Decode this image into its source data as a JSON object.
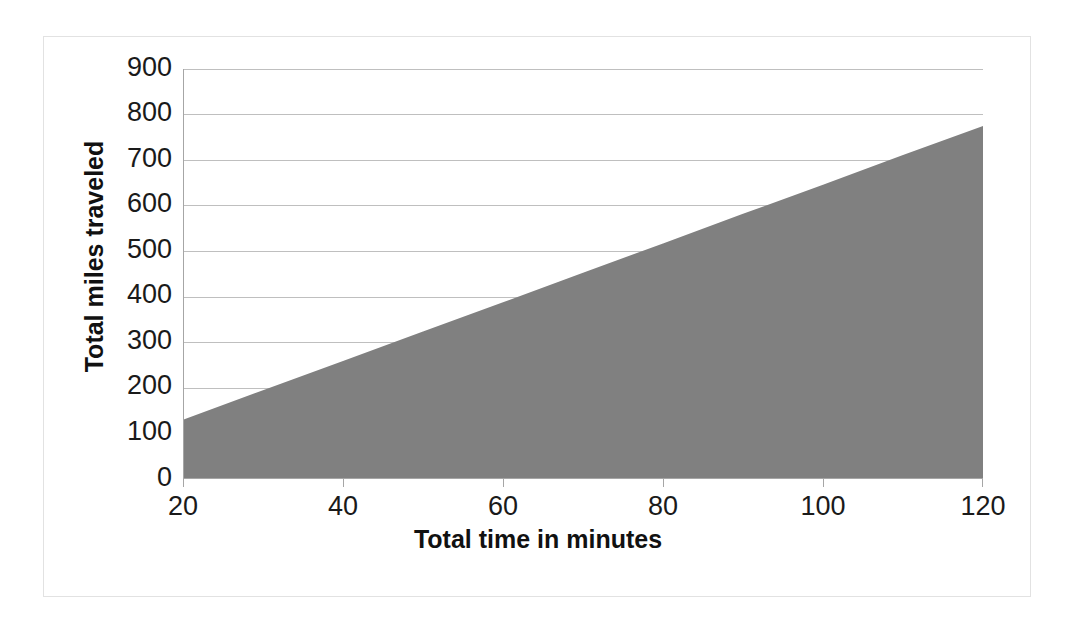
{
  "chart_data": {
    "type": "area",
    "title": "",
    "xlabel": "Total time in minutes",
    "ylabel": "Total miles traveled",
    "xlim": [
      20,
      120
    ],
    "ylim": [
      0,
      900
    ],
    "x_ticks": [
      20,
      40,
      60,
      80,
      100,
      120
    ],
    "y_ticks": [
      0,
      100,
      200,
      300,
      400,
      500,
      600,
      700,
      800,
      900
    ],
    "grid": "horizontal",
    "legend": "none",
    "series": [
      {
        "name": "Total miles traveled",
        "fill_color": "#808080",
        "x": [
          20,
          30,
          40,
          50,
          60,
          70,
          80,
          90,
          100,
          110,
          120
        ],
        "values": [
          130,
          195,
          259,
          324,
          388,
          453,
          517,
          582,
          646,
          711,
          775
        ]
      }
    ],
    "annotations": []
  },
  "axes": {
    "y": {
      "label": "Total miles traveled",
      "ticks": [
        "900",
        "800",
        "700",
        "600",
        "500",
        "400",
        "300",
        "200",
        "100",
        "0"
      ]
    },
    "x": {
      "label": "Total time in minutes",
      "ticks": [
        "20",
        "40",
        "60",
        "80",
        "100",
        "120"
      ]
    }
  },
  "colors": {
    "area_fill": "#808080",
    "gridline": "#bfbfbf",
    "axis": "#a6a6a6",
    "frame_border": "#e2e2e2",
    "tick_text": "#1a1a1a",
    "title_text": "#111111",
    "background": "#ffffff"
  }
}
